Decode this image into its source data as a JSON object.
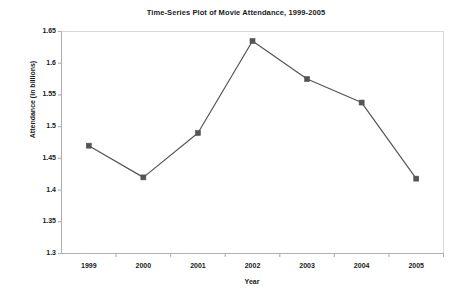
{
  "chart_data": {
    "type": "line",
    "title": "Time-Series Plot of Movie Attendance, 1999-2005",
    "xlabel": "Year",
    "ylabel": "Attendance (in billions)",
    "categories": [
      "1999",
      "2000",
      "2001",
      "2002",
      "2003",
      "2004",
      "2005"
    ],
    "values": [
      1.47,
      1.42,
      1.49,
      1.635,
      1.575,
      1.538,
      1.418
    ],
    "series": [
      {
        "name": "Attendance",
        "values": [
          1.47,
          1.42,
          1.49,
          1.635,
          1.575,
          1.538,
          1.418
        ]
      }
    ],
    "ylim": [
      1.3,
      1.65
    ],
    "yticks": [
      "1.3",
      "1.35",
      "1.4",
      "1.45",
      "1.5",
      "1.55",
      "1.6",
      "1.65"
    ],
    "ytick_values": [
      1.3,
      1.35,
      1.4,
      1.45,
      1.5,
      1.55,
      1.6,
      1.65
    ],
    "grid": false,
    "legend": false,
    "legend_position": "none",
    "marker": "square",
    "line_color": "#555555",
    "marker_color": "#555555",
    "axis_color": "#b0b0b0",
    "plot_background": "#ffffff"
  }
}
